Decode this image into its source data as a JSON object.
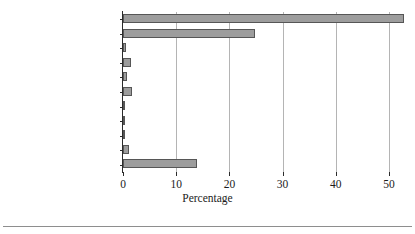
{
  "chart_data": {
    "type": "bar",
    "orientation": "horizontal",
    "title": "",
    "xlabel": "Percentage",
    "ylabel": "",
    "xlim": [
      0,
      53.5
    ],
    "ylim": null,
    "grid": "vertical",
    "legend": null,
    "xticks": [
      "0",
      "10",
      "20",
      "30",
      "40",
      "50"
    ],
    "xtick_values": [
      0,
      10,
      20,
      30,
      40,
      50
    ],
    "categories": [
      "Protestant",
      "Catholic",
      "Orthodox Christian",
      "“Christian”",
      "Interdenominational",
      "Jewish",
      "Buddhist",
      "Hindu",
      "Muslim",
      "Other religion",
      "No Religion"
    ],
    "values": [
      52.8,
      24.8,
      0.5,
      1.5,
      0.7,
      1.7,
      0.4,
      0.2,
      0.4,
      1.1,
      13.9
    ],
    "series": [
      {
        "name": "Percentage",
        "values": [
          52.8,
          24.8,
          0.5,
          1.5,
          0.7,
          1.7,
          0.4,
          0.2,
          0.4,
          1.1,
          13.9
        ]
      }
    ]
  },
  "style": {
    "bar_fill": "#9d9d9d",
    "bar_edge": "#565656",
    "gridline_color": "#b4b4b4",
    "axis_color": "#2b2b2b",
    "text_color": "#1c1c1c",
    "background": "#ffffff"
  }
}
